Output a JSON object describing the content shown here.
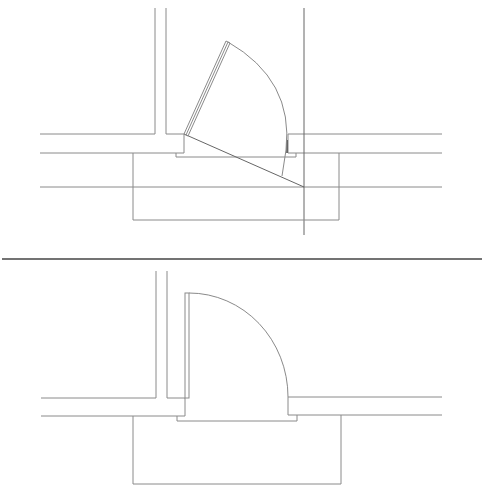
{
  "diagram": {
    "type": "architectural-floor-plan",
    "colors": {
      "background": "#ffffff",
      "line": "#8a8a8a",
      "line_dark": "#555555",
      "separator": "#444444"
    },
    "panels": [
      {
        "id": "top",
        "label": "door-partially-open",
        "lines": [
          {
            "name": "left-wall-outer-vertical",
            "x1": 155,
            "y1": 8,
            "x2": 155,
            "y2": 134
          },
          {
            "name": "left-wall-inner-vertical",
            "x1": 166,
            "y1": 8,
            "x2": 166,
            "y2": 134
          },
          {
            "name": "left-wall-top",
            "x1": 40,
            "y1": 134,
            "x2": 155,
            "y2": 134
          },
          {
            "name": "left-wall-top-stub",
            "x1": 166,
            "y1": 134,
            "x2": 184,
            "y2": 134
          },
          {
            "name": "left-jamb",
            "x1": 184,
            "y1": 134,
            "x2": 184,
            "y2": 153
          },
          {
            "name": "left-wall-bottom",
            "x1": 40,
            "y1": 153,
            "x2": 184,
            "y2": 153
          },
          {
            "name": "right-wall-top",
            "x1": 288,
            "y1": 134,
            "x2": 442,
            "y2": 134
          },
          {
            "name": "right-jamb",
            "x1": 288,
            "y1": 134,
            "x2": 288,
            "y2": 153
          },
          {
            "name": "right-wall-bottom",
            "x1": 288,
            "y1": 153,
            "x2": 442,
            "y2": 153
          },
          {
            "name": "threshold",
            "points": "176,153 176,157 296,157 296,153"
          },
          {
            "name": "reference-line",
            "x1": 40,
            "y1": 187,
            "x2": 442,
            "y2": 187
          },
          {
            "name": "vertical-axis-line",
            "x1": 304,
            "y1": 8,
            "x2": 304,
            "y2": 235
          },
          {
            "name": "bracket",
            "points": "133,153 133,220 339,220 339,153"
          },
          {
            "name": "sightline-diagonal",
            "x1": 184,
            "y1": 134,
            "x2": 304,
            "y2": 187
          }
        ],
        "door_leaf": {
          "hinge": [
            184,
            134
          ],
          "tip": [
            226,
            41
          ],
          "thickness": 4
        },
        "swing_arc": {
          "path": "M 228 42 Q 294 80 286 150 L 282 176"
        },
        "jamb_mark": {
          "x1": 287,
          "y1": 140,
          "x2": 287,
          "y2": 153
        }
      },
      {
        "id": "bottom",
        "label": "door-open-90-degrees",
        "lines": [
          {
            "name": "left-wall-outer-vertical",
            "x1": 156,
            "y1": 271,
            "x2": 156,
            "y2": 398
          },
          {
            "name": "left-wall-inner-vertical",
            "x1": 167,
            "y1": 271,
            "x2": 167,
            "y2": 398
          },
          {
            "name": "left-wall-top",
            "x1": 41,
            "y1": 398,
            "x2": 156,
            "y2": 398
          },
          {
            "name": "left-wall-top-stub",
            "x1": 167,
            "y1": 398,
            "x2": 185,
            "y2": 398
          },
          {
            "name": "left-jamb",
            "x1": 185,
            "y1": 398,
            "x2": 185,
            "y2": 416
          },
          {
            "name": "left-wall-bottom",
            "x1": 41,
            "y1": 416,
            "x2": 185,
            "y2": 416
          },
          {
            "name": "right-wall-top",
            "x1": 288,
            "y1": 397,
            "x2": 442,
            "y2": 397
          },
          {
            "name": "right-jamb",
            "x1": 288,
            "y1": 397,
            "x2": 288,
            "y2": 415
          },
          {
            "name": "right-wall-bottom",
            "x1": 288,
            "y1": 415,
            "x2": 442,
            "y2": 415
          },
          {
            "name": "threshold",
            "points": "177,416 177,421 297,421 297,415"
          },
          {
            "name": "bracket",
            "points": "133,416 133,484 341,484 341,415"
          }
        ],
        "door_leaf": {
          "x": 185,
          "y": 293,
          "width": 4,
          "height": 105
        },
        "swing_arc": {
          "path": "M 189 293 A 99 104 0 0 1 288 397"
        }
      }
    ],
    "separator": {
      "x1": 2,
      "y1": 259,
      "x2": 482,
      "y2": 259
    }
  }
}
